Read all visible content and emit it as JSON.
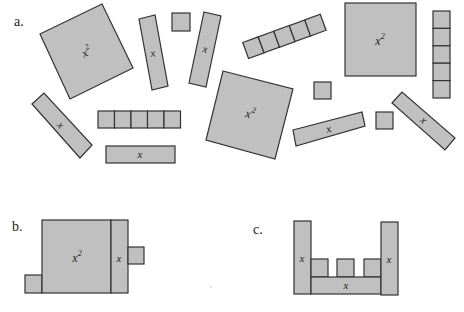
{
  "parts": {
    "a": "a.",
    "b": "b.",
    "c": "c."
  },
  "labels": {
    "x_squared": "x",
    "superscript": "2",
    "x": "x"
  },
  "colors": {
    "tile_fill": "#c0c0c0",
    "tile_stroke": "#333333",
    "background": "#ffffff"
  },
  "tiles": {
    "part_a": {
      "x_squared_tiles": 3,
      "x_tiles": 7,
      "unit_tiles": 13
    },
    "part_b": {
      "x_squared_tiles": 1,
      "x_tiles": 1,
      "unit_tiles": 2
    },
    "part_c": {
      "x_tiles": 3,
      "unit_tiles": 3
    }
  }
}
